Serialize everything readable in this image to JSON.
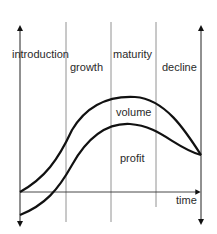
{
  "diagram": {
    "stages": [
      "introduction",
      "growth",
      "maturity",
      "decline"
    ],
    "curves": [
      {
        "name": "volume",
        "label": "volume"
      },
      {
        "name": "profit",
        "label": "profit"
      }
    ],
    "x_axis_label": "time",
    "colors": {
      "line": "#111111",
      "divider": "#777777",
      "text": "#2a2a2a"
    }
  }
}
